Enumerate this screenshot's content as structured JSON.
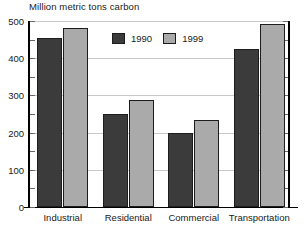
{
  "chart_data": {
    "type": "bar",
    "title": "Million metric tons carbon",
    "xlabel": "",
    "ylabel": "Million metric tons carbon",
    "ylim": [
      0,
      500
    ],
    "yticks": [
      0,
      100,
      200,
      300,
      400,
      500
    ],
    "ytick_labels": [
      "0",
      "100",
      "200",
      "300",
      "400",
      "500"
    ],
    "minor_tick_interval": 50,
    "grid": true,
    "legend_position": "inside-top-center",
    "categories": [
      "Industrial",
      "Residential",
      "Commercial",
      "Transportation"
    ],
    "series": [
      {
        "name": "1990",
        "color": "#3b3b3b",
        "values": [
          455,
          250,
          200,
          425
        ]
      },
      {
        "name": "1999",
        "color": "#aaaaaa",
        "values": [
          482,
          288,
          235,
          492
        ]
      }
    ]
  },
  "legend": {
    "items": [
      {
        "label": "1990",
        "color": "#3b3b3b"
      },
      {
        "label": "1999",
        "color": "#aaaaaa"
      }
    ]
  },
  "colors": {
    "series_1990": "#3b3b3b",
    "series_1999": "#aaaaaa",
    "axis": "#000000",
    "gridline": "#c9c9c9",
    "text": "#1a1a1a",
    "background": "#ffffff"
  }
}
